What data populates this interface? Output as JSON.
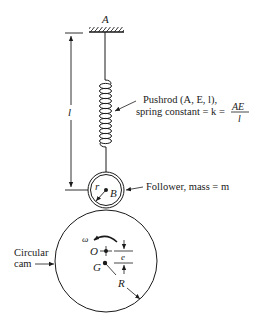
{
  "diagram": {
    "ground": {
      "label": "A"
    },
    "length": {
      "label": "l"
    },
    "pushrod": {
      "line1": "Pushrod (A, E, l),",
      "line2_prefix": "spring constant = k = ",
      "fraction_num": "AE",
      "fraction_den": "l"
    },
    "follower": {
      "label": "Follower, mass = m",
      "center_label": "B",
      "radius_label": "r"
    },
    "cam": {
      "label_line1": "Circular",
      "label_line2": "cam",
      "rotation_label": "ω",
      "center_label": "O",
      "mass_center_label": "G",
      "eccentricity_label": "e",
      "radius_label": "R"
    },
    "colors": {
      "stroke": "#1a1a1a",
      "background": "#ffffff"
    }
  }
}
